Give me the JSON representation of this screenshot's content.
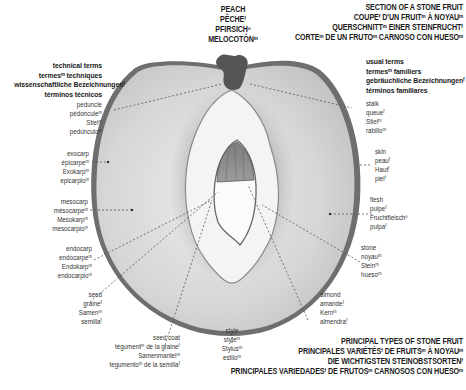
{
  "fruit_title": {
    "lines": [
      "PEACH",
      "PÊCHEᶠ",
      "PFIRSICHⁿ",
      "MELOCOTÓNᵐ"
    ]
  },
  "section_title": {
    "lines": [
      "SECTION OF A STONE FRUIT",
      "COUPEᶠ D'UN FRUITᵐ À NOYAUᵐ",
      "QUERSCHNITTᵐ EINER STEINFRUCHTᶠ",
      "CORTEᵐ DE UN FRUTOᵐ CARNOSO CON HUESOᵐ"
    ]
  },
  "technical_terms_header": {
    "lines": [
      "technical terms",
      "termesᵐ techniques",
      "wissenschaftliche Bezeichnungenᶠ",
      "términos técnicos"
    ]
  },
  "usual_terms_header": {
    "lines": [
      "usual terms",
      "termesᵐ familiers",
      "gebräuchliche Bezeichnungenᶠ",
      "términos familiares"
    ]
  },
  "labels_left": [
    {
      "id": "peduncle",
      "lines": [
        "peduncle",
        "pédonculeᵐ",
        "Stielᵐ",
        "pedúnculoᵐ"
      ]
    },
    {
      "id": "exocarp",
      "lines": [
        "exocarp",
        "épicarpeᵐ",
        "Exokarpᵐ",
        "epicarpioᵐ"
      ]
    },
    {
      "id": "mesocarp",
      "lines": [
        "mesocarp",
        "mésocarpeᵐ",
        "Mesokarpᵐ",
        "mesocarpioᵐ"
      ]
    },
    {
      "id": "endocarp",
      "lines": [
        "endocarp",
        "endocarpeᵐ",
        "Endokarpᵐ",
        "endocarpioᵐ"
      ]
    },
    {
      "id": "seed",
      "lines": [
        "seed",
        "graineᶠ",
        "Samenᵐ",
        "semillaᶠ"
      ]
    },
    {
      "id": "seed-coat",
      "lines": [
        "seed coat",
        "tégumentᵐ de la graineᶠ",
        "Samenmantelᵐ",
        "tegumentoᵐ de la semillaᶠ"
      ]
    }
  ],
  "labels_right": [
    {
      "id": "stalk",
      "lines": [
        "stalk",
        "queueᶠ",
        "Stielᵐ",
        "rabilloᵐ"
      ]
    },
    {
      "id": "skin",
      "lines": [
        "skin",
        "peauᶠ",
        "Hautᶠ",
        "pielᶠ"
      ]
    },
    {
      "id": "flesh",
      "lines": [
        "flesh",
        "pulpeᶠ",
        "Fruchtfleischⁿ",
        "pulpaᶠ"
      ]
    },
    {
      "id": "stone",
      "lines": [
        "stone",
        "noyauᵐ",
        "Steinᵐ",
        "huesoᵐ"
      ]
    },
    {
      "id": "almond",
      "lines": [
        "almond",
        "amandeᶠ",
        "Kernᵐ",
        "almendraᶠ"
      ]
    }
  ],
  "labels_bottom": [
    {
      "id": "style",
      "lines": [
        "style",
        "styleᵐ",
        "Stylusᵐ",
        "estiloᵐ"
      ]
    }
  ],
  "principal_types_title": {
    "lines": [
      "PRINCIPAL TYPES OF STONE FRUIT",
      "PRINCIPALES VARIÉTÉSᶠ DE FRUITSᵐ À NOYAUᵐ",
      "DIE WICHTIGSTEN STEINOBSTSORTENᶠ",
      "PRINCIPALES VARIEDADESᶠ DE FRUTOSᵐ CARNOSOS CON HUESOᵐ"
    ]
  },
  "colors": {
    "background": "#ffffff",
    "flesh": "#d9d9d9",
    "skin_rim": "#6a6a6a",
    "stone": "#f2f2f2",
    "seed": "#8a8a8a",
    "stalk": "#5a5a5a",
    "leader_line": "#555555"
  }
}
